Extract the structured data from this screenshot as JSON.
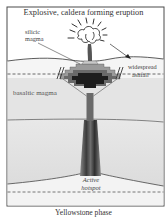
{
  "figure": {
    "title": "Explosive, caldera forming eruption",
    "caption": "Yellowstone phase",
    "labels": {
      "silicic_magma_line1": "silicic",
      "silicic_magma_line2": "magma",
      "ashfall_line1": "widespread",
      "ashfall_line2": "ashfall",
      "basaltic_magma": "basaltic magma",
      "hotspot_line1": "Active",
      "hotspot_line2": "hotspot"
    },
    "colors": {
      "frame": "#4a4a4a",
      "crust_upper": "#f4f4f4",
      "basaltic_layer": "#e6e6e6",
      "mantle": "#e9e9e9",
      "magma_dark": "#1e1e1e",
      "magma_mid": "#6a6a6a",
      "magma_light": "#9a9a9a",
      "conduit": "#5a5a5a"
    }
  }
}
